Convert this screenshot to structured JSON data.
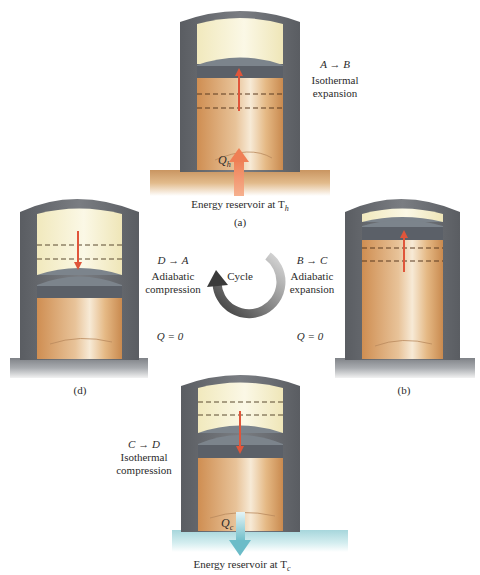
{
  "diagram": {
    "colors": {
      "cylinder_wall": "#6b6e72",
      "cylinder_wall_dark": "#4f5256",
      "piston": "#5b6068",
      "piston_cap": "#7c848c",
      "gas_hot": "#d9a56c",
      "gas_highlight": "#f6e7cf",
      "empty_space": "#f6f1cf",
      "hot_reservoir": "#d9a873",
      "cold_reservoir": "#bfe2e6",
      "base_plate": "#8c8f93",
      "heat_arrow_hot": "#f08a5d",
      "heat_arrow_cold": "#7fc4cf",
      "motion_arrow": "#e0553a"
    },
    "center": {
      "label": "Cycle",
      "icon": "circular-arrow-icon"
    },
    "stages": [
      {
        "id": "a",
        "panel_label": "(a)",
        "transition": "A → B",
        "process": "Isothermal",
        "process_type": "expansion",
        "heat_label": "Q",
        "heat_subscript": "h",
        "reservoir_label": "Energy reservoir at T",
        "reservoir_subscript": "h",
        "piston_motion": "up"
      },
      {
        "id": "b",
        "panel_label": "(b)",
        "transition": "B → C",
        "process": "Adiabatic",
        "process_type": "expansion",
        "heat_text": "Q = 0",
        "piston_motion": "up"
      },
      {
        "id": "c",
        "panel_label": "",
        "transition": "C → D",
        "process": "Isothermal",
        "process_type": "compression",
        "heat_label": "Q",
        "heat_subscript": "c",
        "reservoir_label": "Energy reservoir at T",
        "reservoir_subscript": "c",
        "piston_motion": "down"
      },
      {
        "id": "d",
        "panel_label": "(d)",
        "transition": "D → A",
        "process": "Adiabatic",
        "process_type": "compression",
        "heat_text": "Q = 0",
        "piston_motion": "down"
      }
    ]
  }
}
